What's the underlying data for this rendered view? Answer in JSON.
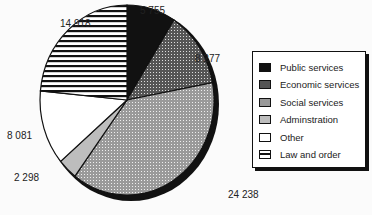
{
  "chart_data": {
    "type": "pie",
    "title": "",
    "start_angle": "12 o'clock, clockwise",
    "slices": [
      {
        "label": "Public services",
        "value": 5755,
        "value_label": "5 755",
        "pattern": "solid-black"
      },
      {
        "label": "Economic services",
        "value": 8277,
        "value_label": "8 277",
        "pattern": "dark-dots"
      },
      {
        "label": "Social services",
        "value": 24238,
        "value_label": "24 238",
        "pattern": "light-dots"
      },
      {
        "label": "Adminstration",
        "value": 2298,
        "value_label": "2 298",
        "pattern": "light-grey"
      },
      {
        "label": "Other",
        "value": 8081,
        "value_label": "8 081",
        "pattern": "white"
      },
      {
        "label": "Law and order",
        "value": 14918,
        "value_label": "14 918",
        "pattern": "horizontal-stripes"
      }
    ],
    "legend": {
      "position": "right",
      "entries": [
        "Public services",
        "Economic services",
        "Social services",
        "Adminstration",
        "Other",
        "Law and order"
      ]
    }
  }
}
